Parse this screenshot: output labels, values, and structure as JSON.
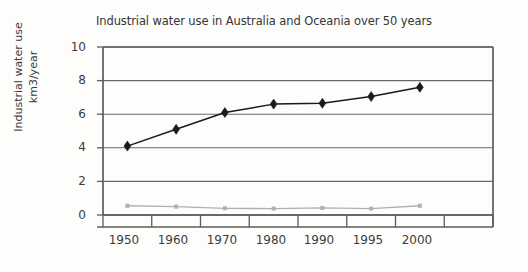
{
  "chart_data": {
    "type": "line",
    "title": "Industrial water use in Australia and Oceania over 50 years",
    "xlabel": "",
    "ylabel": "Industrial water use km3/year",
    "ylabel_lines": [
      "Industrial water use",
      "km3/year"
    ],
    "categories": [
      "1950",
      "1960",
      "1970",
      "1980",
      "1990",
      "1995",
      "2000"
    ],
    "ytick_labels": [
      "0",
      "2",
      "4",
      "6",
      "8",
      "10"
    ],
    "ylim": [
      0,
      10
    ],
    "ytick_step": 2,
    "grid": "horizontal",
    "legend": "none",
    "series": [
      {
        "name": "Industrial water use",
        "marker": "diamond",
        "color": "#1a1a1a",
        "values": [
          4.1,
          5.1,
          6.1,
          6.6,
          6.65,
          7.05,
          7.6
        ]
      },
      {
        "name": "Secondary series",
        "marker": "square",
        "color": "#b0b0b0",
        "values": [
          0.55,
          0.5,
          0.4,
          0.38,
          0.42,
          0.38,
          0.55
        ]
      }
    ]
  },
  "axes": {
    "plot_left": 103,
    "plot_right": 493,
    "plot_top": 47,
    "plot_bottom": 215,
    "category_slots": 8
  },
  "colors": {
    "background": "#fdfdfc",
    "axis": "#5c5c5c",
    "grid": "#6a6a6a",
    "series_primary": "#1a1a1a",
    "series_secondary": "#b0b0b0",
    "text": "#3a3a3a"
  }
}
